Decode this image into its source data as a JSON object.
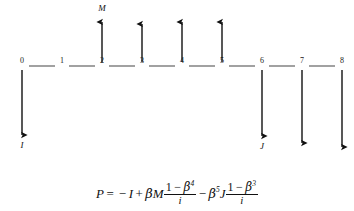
{
  "diagram": {
    "type": "cash-flow-timeline",
    "axis": {
      "start_x": 22,
      "end_x": 342,
      "y": 66,
      "spacing": 40,
      "color": "#555555"
    },
    "nodes": [
      {
        "label": "0",
        "index": 0,
        "x": 22
      },
      {
        "label": "1",
        "index": 1,
        "x": 62
      },
      {
        "label": "2",
        "index": 2,
        "x": 102
      },
      {
        "label": "3",
        "index": 3,
        "x": 142
      },
      {
        "label": "4",
        "index": 4,
        "x": 182
      },
      {
        "label": "5",
        "index": 5,
        "x": 222
      },
      {
        "label": "6",
        "index": 6,
        "x": 262
      },
      {
        "label": "7",
        "index": 7,
        "x": 302
      },
      {
        "label": "8",
        "index": 8,
        "x": 342
      }
    ],
    "arrows": [
      {
        "name": "outflow-0",
        "node": 0,
        "direction": "down",
        "x": 22,
        "from_y": 70,
        "to_y": 135,
        "label": "I",
        "label_x": 22,
        "label_y": 140
      },
      {
        "name": "inflow-2",
        "node": 2,
        "direction": "up",
        "x": 102,
        "from_y": 62,
        "to_y": 22,
        "label": "M",
        "label_x": 102,
        "label_y": 3
      },
      {
        "name": "inflow-3",
        "node": 3,
        "direction": "up",
        "x": 142,
        "from_y": 62,
        "to_y": 24,
        "label": "",
        "label_x": 142,
        "label_y": 6
      },
      {
        "name": "inflow-4",
        "node": 4,
        "direction": "up",
        "x": 182,
        "from_y": 62,
        "to_y": 22,
        "label": "",
        "label_x": 182,
        "label_y": 6
      },
      {
        "name": "inflow-5",
        "node": 5,
        "direction": "up",
        "x": 222,
        "from_y": 62,
        "to_y": 22,
        "label": "",
        "label_x": 222,
        "label_y": 6
      },
      {
        "name": "outflow-6",
        "node": 6,
        "direction": "down",
        "x": 262,
        "from_y": 70,
        "to_y": 136,
        "label": "J",
        "label_x": 262,
        "label_y": 141
      },
      {
        "name": "outflow-7",
        "node": 7,
        "direction": "down",
        "x": 302,
        "from_y": 70,
        "to_y": 143,
        "label": "",
        "label_x": 302,
        "label_y": 148
      },
      {
        "name": "outflow-8",
        "node": 8,
        "direction": "down",
        "x": 342,
        "from_y": 70,
        "to_y": 147,
        "label": "",
        "label_x": 342,
        "label_y": 152
      }
    ],
    "flow_labels": {
      "initial_investment": "I",
      "inflow": "M",
      "outflow": "J"
    }
  },
  "formula": {
    "lhs": "P",
    "equals": "=",
    "minus": "−",
    "plus": "+",
    "investment": "I",
    "beta": "β",
    "inflow_symbol": "M",
    "outflow_symbol": "J",
    "term1_numerator_one": "1",
    "term1_numerator_exponent": "4",
    "term1_denominator": "i",
    "term2_beta_exponent": "5",
    "term2_numerator_one": "1",
    "term2_numerator_exponent": "3",
    "term2_denominator": "i",
    "plain_text": "P = −I + βM(1−β⁴)/i − β⁵J(1−β³)/i"
  },
  "colors": {
    "ink": "#111111",
    "axis": "#555555",
    "background": "#ffffff"
  }
}
